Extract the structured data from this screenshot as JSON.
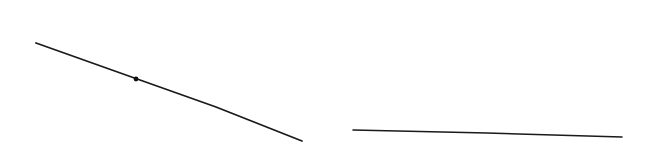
{
  "canvas": {
    "width": 656,
    "height": 148,
    "background_color": "#ffffff",
    "title": "Two-segment line drawing with marked point"
  },
  "style": {
    "stroke_color": "#1a1a1a",
    "dot_color": "#111111",
    "stroke_width": 1.8,
    "thin_stroke_width": 1.6
  },
  "chart_data": {
    "type": "line",
    "title": "",
    "xlabel": "",
    "ylabel": "",
    "xlim": [
      0,
      656
    ],
    "ylim": [
      148,
      0
    ],
    "grid": false,
    "legend": "none",
    "series": [
      {
        "name": "descending-segment",
        "points": [
          {
            "x": 36,
            "y": 43
          },
          {
            "x": 140,
            "y": 80
          },
          {
            "x": 216,
            "y": 107
          },
          {
            "x": 302,
            "y": 141
          }
        ]
      },
      {
        "name": "near-horizontal-segment",
        "points": [
          {
            "x": 353,
            "y": 130
          },
          {
            "x": 487,
            "y": 133
          },
          {
            "x": 622,
            "y": 137
          }
        ]
      }
    ],
    "markers": [
      {
        "name": "point-on-descending-segment",
        "x": 136,
        "y": 79,
        "radius": 2.4,
        "shape": "filled-circle",
        "label": ""
      }
    ],
    "annotations": []
  }
}
